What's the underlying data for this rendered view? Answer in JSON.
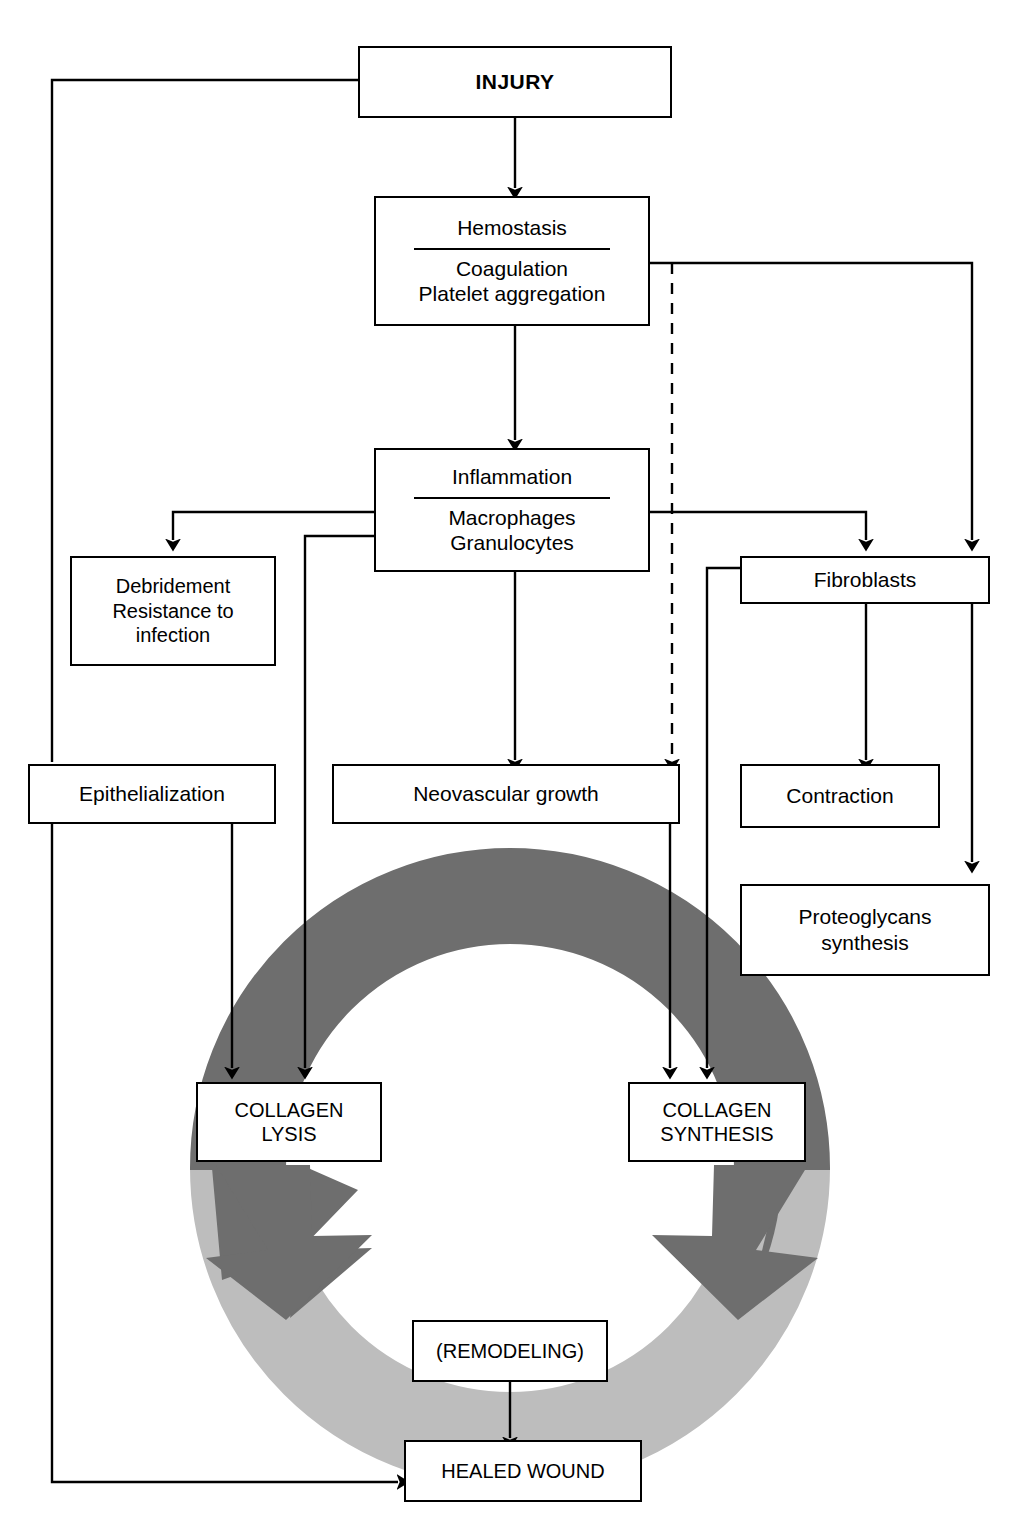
{
  "diagram": {
    "colors": {
      "outline": "#000000",
      "box_fill": "#ffffff",
      "ring_dark": "#6e6e6e",
      "ring_light": "#bdbdbd"
    }
  },
  "nodes": {
    "injury": {
      "label": "INJURY"
    },
    "hemostasis": {
      "header": "Hemostasis",
      "sub1": "Coagulation",
      "sub2": "Platelet aggregation"
    },
    "inflammation": {
      "header": "Inflammation",
      "sub1": "Macrophages",
      "sub2": "Granulocytes"
    },
    "debridement": {
      "line1": "Debridement",
      "line2": "Resistance to",
      "line3": "infection"
    },
    "fibroblasts": {
      "label": "Fibroblasts"
    },
    "epithelialization": {
      "label": "Epithelialization"
    },
    "neovascular": {
      "label": "Neovascular growth"
    },
    "contraction": {
      "label": "Contraction"
    },
    "proteoglycans": {
      "line1": "Proteoglycans",
      "line2": "synthesis"
    },
    "collagen_lysis": {
      "line1": "COLLAGEN",
      "line2": "LYSIS"
    },
    "collagen_synthesis": {
      "line1": "COLLAGEN",
      "line2": "SYNTHESIS"
    },
    "remodeling": {
      "label": "(REMODELING)"
    },
    "healed_wound": {
      "label": "HEALED WOUND"
    }
  },
  "edges": [
    {
      "from": "injury",
      "to": "hemostasis",
      "style": "solid",
      "arrow": true
    },
    {
      "from": "injury",
      "to": "epithelialization",
      "style": "solid",
      "arrow": false
    },
    {
      "from": "hemostasis",
      "to": "inflammation",
      "style": "solid",
      "arrow": true
    },
    {
      "from": "hemostasis",
      "to": "fibroblasts",
      "style": "solid",
      "arrow": true
    },
    {
      "from": "hemostasis",
      "to": "neovascular",
      "style": "dashed",
      "arrow": true
    },
    {
      "from": "inflammation",
      "to": "debridement",
      "style": "solid",
      "arrow": true
    },
    {
      "from": "inflammation",
      "to": "collagen_lysis",
      "style": "solid",
      "arrow": true
    },
    {
      "from": "inflammation",
      "to": "neovascular",
      "style": "solid",
      "arrow": true
    },
    {
      "from": "inflammation",
      "to": "fibroblasts",
      "style": "solid",
      "arrow": true
    },
    {
      "from": "fibroblasts",
      "to": "contraction",
      "style": "solid",
      "arrow": true
    },
    {
      "from": "fibroblasts",
      "to": "proteoglycans",
      "style": "solid",
      "arrow": true
    },
    {
      "from": "fibroblasts",
      "to": "collagen_synthesis",
      "style": "solid",
      "arrow": true
    },
    {
      "from": "neovascular",
      "to": "collagen_synthesis",
      "style": "solid",
      "arrow": true
    },
    {
      "from": "epithelialization",
      "to": "collagen_lysis",
      "style": "solid",
      "arrow": true
    },
    {
      "from": "epithelialization",
      "to": "healed_wound",
      "style": "solid",
      "arrow": true
    },
    {
      "from": "remodeling",
      "to": "healed_wound",
      "style": "solid",
      "arrow": true
    }
  ],
  "cycle": {
    "description": "Collagen lysis and collagen synthesis balance cycle leading to remodeling",
    "upper_arc_color": "#6e6e6e",
    "lower_arc_color": "#bdbdbd"
  }
}
